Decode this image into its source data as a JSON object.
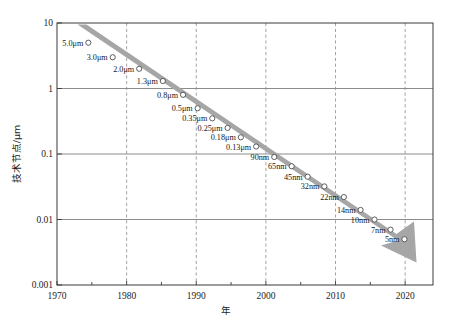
{
  "chart_data": {
    "type": "scatter",
    "title": "",
    "xlabel": "年",
    "ylabel": "技术节点/μm",
    "xlim": [
      1970,
      2024
    ],
    "ylim": [
      0.001,
      10
    ],
    "yscale": "log",
    "grid": "horizontal-solid-decades, vertical-dashed-decades",
    "legend": "none",
    "x_ticks": [
      "1970",
      "1980",
      "1990",
      "2000",
      "2010",
      "2020"
    ],
    "x_tick_values": [
      1970,
      1980,
      1990,
      2000,
      2010,
      2020
    ],
    "y_ticks": [
      "10",
      "1",
      "0.1",
      "0.01",
      "0.001"
    ],
    "y_tick_values": [
      10,
      1,
      0.1,
      0.01,
      0.001
    ],
    "annotation": "downward trend arrow following the data points",
    "points": [
      {
        "label": "5.0μm",
        "year": 1974.5,
        "value": 5.0
      },
      {
        "label": "3.0μm",
        "year": 1978.0,
        "value": 3.0
      },
      {
        "label": "2.0μm",
        "year": 1981.8,
        "value": 2.0
      },
      {
        "label": "1.3μm",
        "year": 1985.2,
        "value": 1.3
      },
      {
        "label": "0.8μm",
        "year": 1988.1,
        "value": 0.8
      },
      {
        "label": "0.5μm",
        "year": 1990.2,
        "value": 0.5
      },
      {
        "label": "0.35μm",
        "year": 1992.3,
        "value": 0.35
      },
      {
        "label": "0.25μm",
        "year": 1994.5,
        "value": 0.25
      },
      {
        "label": "0.18μm",
        "year": 1996.4,
        "value": 0.18
      },
      {
        "label": "0.13μm",
        "year": 1998.6,
        "value": 0.13
      },
      {
        "label": "90nm",
        "year": 2001.2,
        "value": 0.09
      },
      {
        "label": "65nm",
        "year": 2003.7,
        "value": 0.065
      },
      {
        "label": "45nm",
        "year": 2006.0,
        "value": 0.045
      },
      {
        "label": "32nm",
        "year": 2008.4,
        "value": 0.032
      },
      {
        "label": "22nm",
        "year": 2011.2,
        "value": 0.022
      },
      {
        "label": "14nm",
        "year": 2013.6,
        "value": 0.014
      },
      {
        "label": "10nm",
        "year": 2015.6,
        "value": 0.01
      },
      {
        "label": "7nm",
        "year": 2017.9,
        "value": 0.007
      },
      {
        "label": "5nm",
        "year": 2019.9,
        "value": 0.005
      }
    ]
  },
  "colors": {
    "trend_band": "#a6a6a6",
    "marker_stroke": "#4d4d4d",
    "marker_fill": "#ffffff",
    "frame": "#3a3a3a",
    "grid_horizontal": "#6e6e6e",
    "grid_vertical": "#8c8c8c",
    "background": "#ffffff",
    "text": "#1a1a1a"
  }
}
